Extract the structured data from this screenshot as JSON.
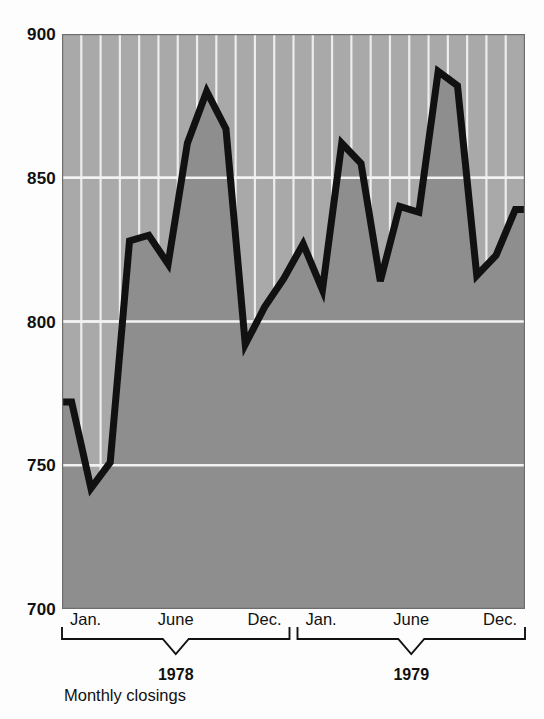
{
  "caption": "Monthly closings",
  "colors": {
    "plot_background_above": "#a9a9a9",
    "plot_area_fill_below_line": "#8e8e8e",
    "gridline": "#ededed",
    "data_line": "#111111",
    "plot_border": "#6a6a6a",
    "text": "#111111",
    "page_background": "#fdfdfd"
  },
  "y_axis": {
    "ticks": [
      {
        "label": "900",
        "value": 900
      },
      {
        "label": "850",
        "value": 850
      },
      {
        "label": "800",
        "value": 800
      },
      {
        "label": "750",
        "value": 750
      },
      {
        "label": "700",
        "value": 700
      }
    ],
    "min": 700,
    "max": 900
  },
  "x_axis": {
    "groups": [
      {
        "year": "1978",
        "month_ticks": [
          {
            "label": "Jan."
          },
          {
            "label": "June"
          },
          {
            "label": "Dec."
          }
        ]
      },
      {
        "year": "1979",
        "month_ticks": [
          {
            "label": "Jan."
          },
          {
            "label": "June"
          },
          {
            "label": "Dec."
          }
        ]
      }
    ]
  },
  "chart_data": {
    "type": "area",
    "title": "",
    "subtitle": "",
    "xlabel": "",
    "ylabel": "",
    "caption": "Monthly closings",
    "ylim": [
      700,
      900
    ],
    "yticks": [
      700,
      750,
      800,
      850,
      900
    ],
    "grid": true,
    "gridlines": {
      "horizontal": true,
      "vertical": true,
      "vertical_count": 24
    },
    "legend": null,
    "legend_position": "none",
    "categories": [
      "Jan. 1978",
      "Feb. 1978",
      "Mar. 1978",
      "Apr. 1978",
      "May 1978",
      "June 1978",
      "July 1978",
      "Aug. 1978",
      "Sept. 1978",
      "Oct. 1978",
      "Nov. 1978",
      "Dec. 1978",
      "Jan. 1979",
      "Feb. 1979",
      "Mar. 1979",
      "Apr. 1979",
      "May 1979",
      "June 1979",
      "July 1979",
      "Aug. 1979",
      "Sept. 1979",
      "Oct. 1979",
      "Nov. 1979",
      "Dec. 1979"
    ],
    "values": [
      772,
      742,
      751,
      828,
      830,
      820,
      862,
      880,
      867,
      792,
      805,
      815,
      827,
      811,
      862,
      855,
      814,
      840,
      838,
      887,
      882,
      816,
      823,
      839
    ],
    "series": [
      {
        "name": "Monthly closings",
        "values": [
          772,
          742,
          751,
          828,
          830,
          820,
          862,
          880,
          867,
          792,
          805,
          815,
          827,
          811,
          862,
          855,
          814,
          840,
          838,
          887,
          882,
          816,
          823,
          839
        ]
      }
    ],
    "annotations": []
  }
}
